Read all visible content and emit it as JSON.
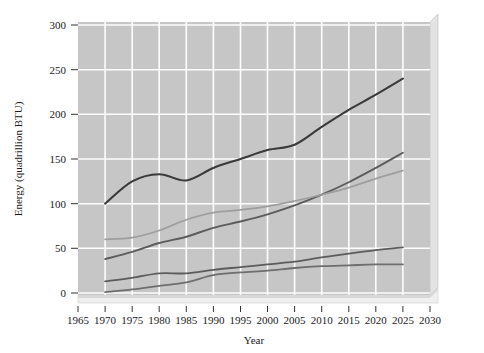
{
  "chart_data": {
    "type": "line",
    "title": "",
    "xlabel": "Year",
    "ylabel": "Energy (quadrillion BTU)",
    "xlim": [
      1965,
      2030
    ],
    "ylim": [
      0,
      300
    ],
    "xticks": [
      1965,
      1970,
      1975,
      1980,
      1985,
      1990,
      1995,
      2000,
      2005,
      2010,
      2015,
      2020,
      2025,
      2030
    ],
    "yticks": [
      0,
      50,
      100,
      150,
      200,
      250,
      300
    ],
    "grid": true,
    "legend": "none",
    "plot_background": "#c6c6c6",
    "gridline_color": "#fdfdfd",
    "x": [
      1970,
      1975,
      1980,
      1985,
      1990,
      1995,
      2000,
      2005,
      2010,
      2015,
      2020,
      2025
    ],
    "series": [
      {
        "name": "series-1-total",
        "color": "#3a3a3a",
        "width": 2.1,
        "values": [
          100,
          125,
          133,
          126,
          140,
          150,
          160,
          166,
          186,
          205,
          222,
          240
        ]
      },
      {
        "name": "series-2",
        "color": "#5c5c5c",
        "width": 1.9,
        "values": [
          38,
          46,
          56,
          63,
          73,
          80,
          88,
          98,
          110,
          124,
          140,
          157
        ]
      },
      {
        "name": "series-3-light",
        "color": "#9e9e9e",
        "width": 1.7,
        "values": [
          60,
          62,
          70,
          82,
          90,
          93,
          97,
          103,
          110,
          118,
          128,
          137
        ]
      },
      {
        "name": "series-4",
        "color": "#5c5c5c",
        "width": 1.8,
        "values": [
          13,
          17,
          22,
          22,
          26,
          29,
          32,
          35,
          40,
          44,
          48,
          51
        ]
      },
      {
        "name": "series-5",
        "color": "#6e6e6e",
        "width": 1.8,
        "values": [
          1,
          4,
          8,
          12,
          20,
          23,
          25,
          28,
          30,
          31,
          32,
          32
        ]
      }
    ]
  },
  "axes": {
    "y_title": "Energy (quadrillion BTU)",
    "x_title": "Year",
    "y_tick_labels": [
      "300",
      "250",
      "200",
      "150",
      "100",
      "50",
      "0"
    ],
    "x_tick_labels": [
      "1965",
      "1970",
      "1975",
      "1980",
      "1985",
      "1990",
      "1995",
      "2000",
      "2005",
      "2010",
      "2015",
      "2020",
      "2025",
      "2030"
    ]
  }
}
